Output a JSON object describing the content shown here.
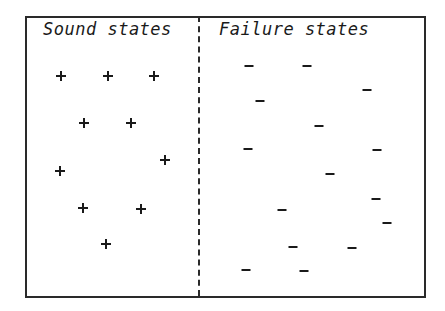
{
  "diagram": {
    "regions": [
      {
        "id": "sound",
        "title": "Sound states",
        "marker": "+"
      },
      {
        "id": "failure",
        "title": "Failure states",
        "marker": "-"
      }
    ],
    "divider": "dashed-vertical",
    "colors": {
      "ink": "#1a1a1a",
      "background": "#ffffff",
      "frame": "#2a2a2a"
    }
  },
  "sound_points": [
    {
      "x": 61,
      "y": 76
    },
    {
      "x": 108,
      "y": 76
    },
    {
      "x": 154,
      "y": 76
    },
    {
      "x": 84,
      "y": 123
    },
    {
      "x": 131,
      "y": 123
    },
    {
      "x": 165,
      "y": 160
    },
    {
      "x": 60,
      "y": 171
    },
    {
      "x": 83,
      "y": 208
    },
    {
      "x": 141,
      "y": 209
    },
    {
      "x": 106,
      "y": 244
    }
  ],
  "failure_points": [
    {
      "x": 249,
      "y": 66
    },
    {
      "x": 307,
      "y": 66
    },
    {
      "x": 367,
      "y": 90
    },
    {
      "x": 260,
      "y": 101
    },
    {
      "x": 319,
      "y": 126
    },
    {
      "x": 248,
      "y": 149
    },
    {
      "x": 377,
      "y": 150
    },
    {
      "x": 330,
      "y": 174
    },
    {
      "x": 376,
      "y": 199
    },
    {
      "x": 282,
      "y": 210
    },
    {
      "x": 387,
      "y": 223
    },
    {
      "x": 293,
      "y": 247
    },
    {
      "x": 352,
      "y": 248
    },
    {
      "x": 246,
      "y": 270
    },
    {
      "x": 304,
      "y": 271
    }
  ]
}
